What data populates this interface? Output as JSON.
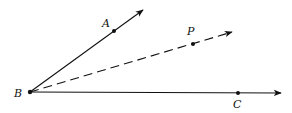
{
  "diagram": {
    "points": {
      "B": {
        "label": "B",
        "x": 30,
        "y": 92
      },
      "A": {
        "label": "A",
        "x": 114,
        "y": 31
      },
      "P": {
        "label": "P",
        "x": 193,
        "y": 44
      },
      "C": {
        "label": "C",
        "x": 238,
        "y": 93
      }
    },
    "rays": [
      {
        "name": "BA",
        "style": "solid",
        "from": "B",
        "to": [
          143,
          10
        ]
      },
      {
        "name": "BP",
        "style": "dashed",
        "from": "B",
        "to": [
          232,
          32
        ]
      },
      {
        "name": "BC",
        "style": "solid",
        "from": "B",
        "to": [
          281,
          93
        ]
      }
    ],
    "colors": {
      "stroke": "#111111",
      "background": "#ffffff"
    }
  }
}
